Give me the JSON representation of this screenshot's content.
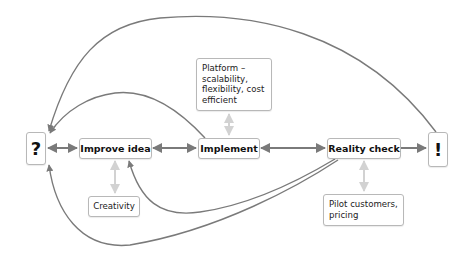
{
  "diagram": {
    "type": "flow",
    "colors": {
      "main_arrow": "#7a7a7a",
      "secondary_arrow": "#d2d2d2",
      "node_border": "#b8b8b8",
      "text": "#111111"
    },
    "nodes": {
      "question": {
        "label": "?"
      },
      "improve_idea": {
        "label": "Improve idea"
      },
      "implement": {
        "label": "Implement"
      },
      "reality_check": {
        "label": "Reality check"
      },
      "exclamation": {
        "label": "!"
      },
      "platform": {
        "label": "Platform – scalability, flexibility, cost efficient",
        "lines": [
          "Platform –",
          "scalability,",
          "flexibility, cost",
          "efficient"
        ]
      },
      "creativity": {
        "label": "Creativity"
      },
      "pilot": {
        "label": "Pilot customers, pricing",
        "lines": [
          "Pilot customers,",
          "pricing"
        ]
      }
    },
    "edges": [
      {
        "from": "?",
        "to": "Improve idea",
        "style": "double-arrow"
      },
      {
        "from": "Improve idea",
        "to": "Implement",
        "style": "double-arrow"
      },
      {
        "from": "Implement",
        "to": "Reality check",
        "style": "double-arrow"
      },
      {
        "from": "Reality check",
        "to": "!",
        "style": "arrow"
      },
      {
        "from": "!",
        "to": "?",
        "style": "curved-arrow-top"
      },
      {
        "from": "Implement",
        "to": "?",
        "style": "curved-arrow"
      },
      {
        "from": "Reality check",
        "to": "Improve idea",
        "style": "curved-arrow-bottom"
      },
      {
        "from": "Reality check",
        "to": "?",
        "style": "curved-arrow-bottom"
      },
      {
        "from": "Platform",
        "to": "Implement",
        "style": "light-double-arrow"
      },
      {
        "from": "Creativity",
        "to": "Improve idea",
        "style": "light-double-arrow"
      },
      {
        "from": "Pilot customers, pricing",
        "to": "Reality check",
        "style": "light-double-arrow"
      }
    ]
  }
}
